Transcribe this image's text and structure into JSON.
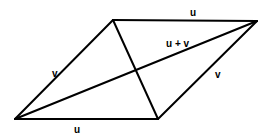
{
  "diagram": {
    "type": "parallelogram-vector-addition",
    "stroke_color": "#000000",
    "background": "#ffffff",
    "vertices": {
      "bottom_left": [
        15,
        119
      ],
      "bottom_right": [
        158,
        119
      ],
      "top_left": [
        113,
        20
      ],
      "top_right": [
        257,
        21
      ]
    },
    "labels": {
      "top_u": "u",
      "bottom_u": "u",
      "left_v": "v",
      "right_v": "v",
      "diagonal_sum": "u + v"
    }
  }
}
